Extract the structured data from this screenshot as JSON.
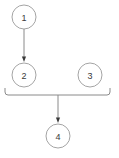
{
  "diagram": {
    "type": "flowchart",
    "title": "",
    "background_color": "#ffffff",
    "node_stroke_color": "#9a9a9a",
    "node_fill_color": "#ffffff",
    "node_stroke_width": 0.9,
    "edge_color": "#8a8a8a",
    "edge_width": 1.0,
    "arrow_color": "#3a3a3a",
    "label_color": "#3a3a3a",
    "nodes": [
      {
        "id": "n1",
        "label": "1",
        "cx": 24,
        "cy": 17,
        "r": 12
      },
      {
        "id": "n2",
        "label": "2",
        "cx": 24,
        "cy": 75,
        "r": 12
      },
      {
        "id": "n3",
        "label": "3",
        "cx": 90,
        "cy": 75,
        "r": 12
      },
      {
        "id": "n4",
        "label": "4",
        "cx": 58,
        "cy": 136,
        "r": 12
      }
    ],
    "edges": [
      {
        "id": "e1",
        "from": "n1",
        "to": "n2",
        "label": "",
        "arrow": true,
        "x1": 24,
        "y1": 29,
        "x2": 24,
        "y2": 62
      },
      {
        "id": "e2",
        "from": "bracket",
        "to": "n4",
        "label": "",
        "arrow": true,
        "x1": 58,
        "y1": 95,
        "x2": 58,
        "y2": 123
      }
    ],
    "bracket": {
      "id": "join-bracket",
      "description": "horizontal join bracket under nodes 2 and 3",
      "left_x": 5,
      "right_x": 110,
      "top_y": 88,
      "bar_y": 95,
      "corner_radius": 3
    }
  }
}
